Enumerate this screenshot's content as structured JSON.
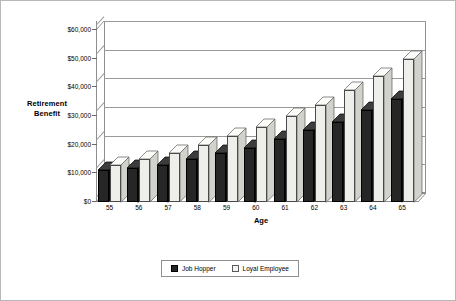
{
  "chart_data": {
    "type": "bar",
    "title": "",
    "subtitle": "",
    "xlabel": "Age",
    "ylabel": "Retirement Benefit",
    "ylabel_lines": [
      "Retirement",
      "Benefit"
    ],
    "categories": [
      "55",
      "56",
      "57",
      "58",
      "59",
      "60",
      "61",
      "62",
      "63",
      "64",
      "65"
    ],
    "ytick_labels": [
      "$0",
      "$10,000",
      "$20,000",
      "$30,000",
      "$40,000",
      "$50,000",
      "$60,000"
    ],
    "ytick_values": [
      0,
      10000,
      20000,
      30000,
      40000,
      50000,
      60000
    ],
    "ylim": [
      0,
      60000
    ],
    "grid": true,
    "legend_position": "bottom",
    "style": "3d-clustered-column",
    "series": [
      {
        "name": "Job Hopper",
        "color": "#262626",
        "values": [
          11000,
          12000,
          13000,
          15000,
          17000,
          19000,
          22000,
          25000,
          28000,
          32000,
          36000
        ]
      },
      {
        "name": "Loyal Employee",
        "color": "#eeeeea",
        "values": [
          13000,
          15000,
          17000,
          20000,
          23000,
          26000,
          30000,
          34000,
          39000,
          44000,
          50000
        ]
      }
    ]
  },
  "legend": {
    "items": [
      {
        "label": "Job Hopper",
        "swatch": "dark"
      },
      {
        "label": "Loyal Employee",
        "swatch": "light"
      }
    ]
  }
}
